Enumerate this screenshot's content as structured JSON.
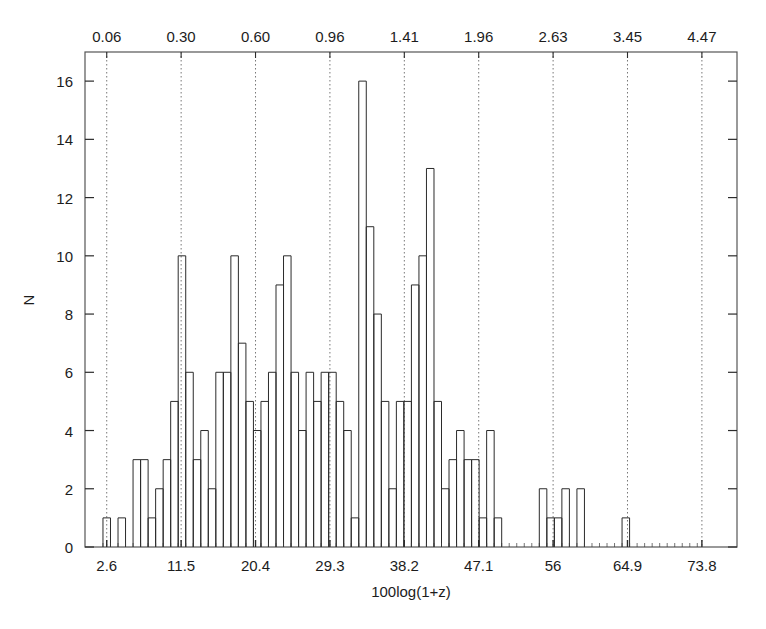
{
  "figure": {
    "title_partial": "",
    "width": 766,
    "height": 629
  },
  "chart_data": {
    "type": "bar",
    "title": "",
    "subtitle": "",
    "xlabel": "100log(1+z)",
    "ylabel": "N",
    "grid": true,
    "legend": null,
    "xlim": [
      0.0,
      78.0
    ],
    "ylim": [
      0,
      17
    ],
    "bin_width": 0.9,
    "x_ticks": [
      "2.6",
      "11.5",
      "20.4",
      "29.3",
      "38.2",
      "47.1",
      "56",
      "64.9",
      "73.8"
    ],
    "x_tick_values": [
      2.6,
      11.5,
      20.4,
      29.3,
      38.2,
      47.1,
      56.0,
      64.9,
      73.8
    ],
    "y_ticks": [
      "0",
      "2",
      "4",
      "6",
      "8",
      "10",
      "12",
      "14",
      "16"
    ],
    "y_tick_values": [
      0,
      2,
      4,
      6,
      8,
      10,
      12,
      14,
      16
    ],
    "secondary_axis": {
      "position": "top",
      "label": "",
      "ticks": [
        "0.06",
        "0.30",
        "0.60",
        "0.96",
        "1.41",
        "1.96",
        "2.63",
        "3.45",
        "4.47"
      ],
      "tick_values": [
        0.06,
        0.3,
        0.6,
        0.96,
        1.41,
        1.96,
        2.63,
        3.45,
        4.47
      ],
      "tick_x_positions": [
        2.6,
        11.5,
        20.4,
        29.3,
        38.2,
        47.1,
        56.0,
        64.9,
        73.8
      ],
      "gridline_style": "dotted"
    },
    "categories": [
      2.6,
      3.5,
      4.4,
      5.3,
      6.2,
      7.1,
      8.0,
      8.9,
      9.8,
      10.7,
      11.6,
      12.5,
      13.4,
      14.3,
      15.2,
      16.1,
      17.0,
      17.9,
      18.8,
      19.7,
      20.6,
      21.5,
      22.4,
      23.3,
      24.2,
      25.1,
      26.0,
      26.9,
      27.8,
      28.7,
      29.6,
      30.5,
      31.4,
      32.3,
      33.2,
      34.1,
      35.0,
      35.9,
      36.8,
      37.7,
      38.6,
      39.5,
      40.4,
      41.3,
      42.2,
      43.1,
      44.0,
      44.9,
      45.8,
      46.7,
      47.6,
      48.5,
      49.4,
      50.3,
      51.2,
      52.1,
      53.0,
      53.9,
      54.8,
      55.7,
      56.6,
      57.5,
      58.4,
      59.3,
      60.2,
      61.1,
      62.0,
      62.9,
      63.8,
      64.7,
      65.6,
      66.5,
      67.4,
      68.3,
      69.2,
      70.1,
      71.0,
      71.9,
      72.8,
      73.7
    ],
    "values": [
      1,
      0,
      1,
      0,
      3,
      3,
      1,
      2,
      3,
      5,
      10,
      6,
      3,
      4,
      2,
      6,
      6,
      10,
      7,
      5,
      4,
      5,
      6,
      9,
      10,
      6,
      4,
      6,
      5,
      6,
      6,
      5,
      4,
      1,
      16,
      11,
      8,
      5,
      2,
      5,
      5,
      9,
      10,
      13,
      5,
      2,
      3,
      4,
      3,
      3,
      1,
      4,
      1,
      0,
      0,
      0,
      0,
      0,
      2,
      1,
      1,
      2,
      0,
      2,
      0,
      0,
      0,
      0,
      0,
      1,
      0,
      0,
      0,
      0,
      0,
      0,
      0,
      0,
      0,
      0
    ]
  }
}
